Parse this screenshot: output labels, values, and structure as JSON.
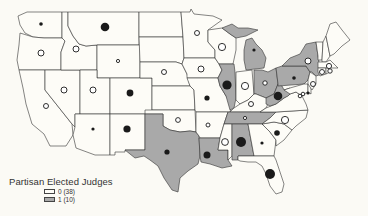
{
  "colors": {
    "background": "#fbfaf5",
    "state_zero": "#fdfcf7",
    "state_one": "#a9a9a9",
    "border": "#333333",
    "dot": "#1a1a1a"
  },
  "legend": {
    "title": "Partisan Elected Judges",
    "items": [
      {
        "label": "0 (38)",
        "value": 0,
        "count": 38,
        "color": "#fdfcf7"
      },
      {
        "label": "1 (10)",
        "value": 1,
        "count": 10,
        "color": "#a9a9a9"
      }
    ]
  },
  "map": {
    "shaded_states": [
      "MI",
      "IL",
      "OH",
      "PA",
      "NY",
      "WV",
      "TN",
      "AL",
      "TX",
      "LA"
    ],
    "symbols": [
      {
        "state": "WA",
        "x": 41,
        "y": 24,
        "r": 1.8,
        "filled": true
      },
      {
        "state": "OR",
        "x": 41,
        "y": 53,
        "r": 3,
        "filled": false
      },
      {
        "state": "ID",
        "x": 76,
        "y": 49,
        "r": 3,
        "filled": false
      },
      {
        "state": "MT",
        "x": 105,
        "y": 27,
        "r": 4.3,
        "filled": true
      },
      {
        "state": "WY",
        "x": 118,
        "y": 61,
        "r": 1.6,
        "filled": false
      },
      {
        "state": "CA",
        "x": 46,
        "y": 106,
        "r": 2.5,
        "filled": false
      },
      {
        "state": "NV",
        "x": 64,
        "y": 90,
        "r": 3,
        "filled": false
      },
      {
        "state": "UT",
        "x": 93,
        "y": 90,
        "r": 3,
        "filled": false
      },
      {
        "state": "CO",
        "x": 130,
        "y": 93,
        "r": 3.4,
        "filled": true
      },
      {
        "state": "AZ",
        "x": 93,
        "y": 129,
        "r": 1.6,
        "filled": true
      },
      {
        "state": "NM",
        "x": 127,
        "y": 129,
        "r": 3.6,
        "filled": true
      },
      {
        "state": "NE",
        "x": 164,
        "y": 72,
        "r": 2.5,
        "filled": false
      },
      {
        "state": "MN",
        "x": 197,
        "y": 33,
        "r": 2.5,
        "filled": false
      },
      {
        "state": "IA",
        "x": 201,
        "y": 69,
        "r": 3,
        "filled": false
      },
      {
        "state": "MO",
        "x": 207,
        "y": 98,
        "r": 2.6,
        "filled": true
      },
      {
        "state": "OK",
        "x": 178,
        "y": 120,
        "r": 2.4,
        "filled": false
      },
      {
        "state": "AR",
        "x": 208,
        "y": 125,
        "r": 2,
        "filled": false
      },
      {
        "state": "TX",
        "x": 167,
        "y": 152,
        "r": 2.6,
        "filled": true
      },
      {
        "state": "LA",
        "x": 207,
        "y": 155,
        "r": 3.5,
        "filled": true
      },
      {
        "state": "WI",
        "x": 222,
        "y": 47,
        "r": 3.6,
        "filled": false
      },
      {
        "state": "MI",
        "x": 254,
        "y": 50,
        "r": 1.6,
        "filled": true
      },
      {
        "state": "IL",
        "x": 227,
        "y": 85,
        "r": 4.6,
        "filled": true
      },
      {
        "state": "IN",
        "x": 245,
        "y": 86,
        "r": 3.6,
        "filled": false
      },
      {
        "state": "OH",
        "x": 265,
        "y": 83,
        "r": 2.2,
        "filled": false
      },
      {
        "state": "KY",
        "x": 251,
        "y": 104,
        "r": 2.5,
        "filled": false
      },
      {
        "state": "WV",
        "x": 278,
        "y": 96,
        "r": 4.3,
        "filled": true
      },
      {
        "state": "TN",
        "x": 245,
        "y": 118,
        "r": 1.6,
        "filled": false
      },
      {
        "state": "MS",
        "x": 225,
        "y": 142,
        "r": 3.4,
        "filled": false
      },
      {
        "state": "AL",
        "x": 241,
        "y": 142,
        "r": 5,
        "filled": true
      },
      {
        "state": "GA",
        "x": 262,
        "y": 143,
        "r": 1.6,
        "filled": true
      },
      {
        "state": "SC",
        "x": 277,
        "y": 133,
        "r": 2.8,
        "filled": true
      },
      {
        "state": "NC",
        "x": 285,
        "y": 120,
        "r": 3.6,
        "filled": false
      },
      {
        "state": "FL",
        "x": 270,
        "y": 174,
        "r": 5,
        "filled": true
      },
      {
        "state": "PA",
        "x": 294,
        "y": 78,
        "r": 1.8,
        "filled": true
      },
      {
        "state": "NY",
        "x": 308,
        "y": 61,
        "r": 3,
        "filled": false
      },
      {
        "state": "VA",
        "x": 300,
        "y": 96,
        "r": 1.8,
        "filled": false
      },
      {
        "state": "MD",
        "x": 303,
        "y": 94,
        "r": 1.8,
        "filled": false
      },
      {
        "state": "DE",
        "x": 308,
        "y": 93,
        "r": 1.6,
        "filled": true
      },
      {
        "state": "NJ",
        "x": 313,
        "y": 84,
        "r": 2.5,
        "filled": false
      },
      {
        "state": "CT",
        "x": 322,
        "y": 72,
        "r": 2.5,
        "filled": false
      },
      {
        "state": "RI",
        "x": 330,
        "y": 71,
        "r": 2.2,
        "filled": false
      },
      {
        "state": "MA",
        "x": 329,
        "y": 66,
        "r": 2.6,
        "filled": false
      }
    ]
  }
}
